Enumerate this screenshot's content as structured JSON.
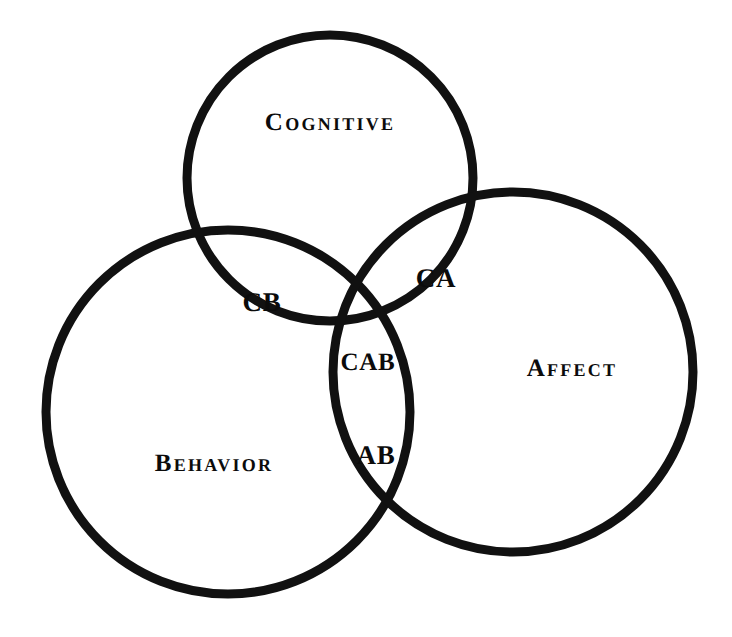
{
  "figure": {
    "type": "venn-diagram",
    "set_count": 3,
    "background_color": "#ffffff",
    "stroke_color": "#111111",
    "text_color": "#0b0b0b",
    "stroke_width_px": 9
  },
  "sets": [
    {
      "id": "cognitive",
      "label": "Cognitive",
      "cx": 330,
      "cy": 178,
      "r": 143,
      "label_x": 330,
      "label_y": 122
    },
    {
      "id": "behavior",
      "label": "Behavior",
      "cx": 228,
      "cy": 412,
      "r": 182,
      "label_x": 214,
      "label_y": 463
    },
    {
      "id": "affect",
      "label": "Affect",
      "cx": 513,
      "cy": 372,
      "r": 180,
      "label_x": 572,
      "label_y": 368
    }
  ],
  "regions": [
    {
      "id": "cb",
      "label": "CB",
      "members": "Cognitive + Behavior",
      "label_x": 262,
      "label_y": 302
    },
    {
      "id": "ca",
      "label": "CA",
      "members": "Cognitive + Affect",
      "label_x": 436,
      "label_y": 278
    },
    {
      "id": "cab",
      "label": "CAB",
      "members": "Cognitive + Affect + Behavior",
      "label_x": 368,
      "label_y": 362
    },
    {
      "id": "ab",
      "label": "AB",
      "members": "Affect + Behavior",
      "label_x": 376,
      "label_y": 455
    }
  ]
}
